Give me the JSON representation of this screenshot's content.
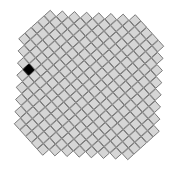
{
  "figure": {
    "title": "",
    "background_color": "#ffffff",
    "width": 179,
    "height": 170
  },
  "chart_data": {
    "type": "heatmap",
    "title": "",
    "subtitle": "",
    "xlabel": "",
    "ylabel": "",
    "grid": false,
    "legend": null,
    "geometry": {
      "cell_size_px": 8.6,
      "rotation_deg": -42,
      "origin_x_px": 89,
      "origin_y_px": 85,
      "cols": 19,
      "rows": 19
    },
    "colors": {
      "cell_fill": "#d6d6d6",
      "cell_stroke": "#777777",
      "selected_fill": "#000000",
      "background": "#ffffff"
    },
    "selected_cell": {
      "col": 5,
      "row": 3,
      "value": 1
    },
    "categories": [
      "col-0",
      "col-1",
      "col-2",
      "col-3",
      "col-4",
      "col-5",
      "col-6",
      "col-7",
      "col-8",
      "col-9",
      "col-10",
      "col-11",
      "col-12",
      "col-13",
      "col-14",
      "col-15",
      "col-16",
      "col-17",
      "col-18"
    ],
    "values": [
      [
        0,
        0,
        0,
        0,
        0,
        0,
        0,
        1,
        1,
        1,
        1,
        1,
        0,
        0,
        0,
        0,
        0,
        0,
        0
      ],
      [
        0,
        0,
        0,
        0,
        0,
        0,
        1,
        1,
        1,
        1,
        1,
        1,
        1,
        0,
        0,
        0,
        0,
        0,
        0
      ],
      [
        0,
        0,
        0,
        0,
        0,
        1,
        1,
        1,
        1,
        1,
        1,
        1,
        1,
        1,
        0,
        0,
        0,
        0,
        0
      ],
      [
        0,
        0,
        0,
        0,
        1,
        1,
        1,
        1,
        1,
        1,
        1,
        1,
        1,
        1,
        1,
        0,
        0,
        0,
        0
      ],
      [
        0,
        0,
        0,
        1,
        1,
        1,
        1,
        1,
        1,
        1,
        1,
        1,
        1,
        1,
        1,
        1,
        0,
        0,
        0
      ],
      [
        0,
        0,
        1,
        1,
        1,
        1,
        1,
        1,
        1,
        1,
        1,
        1,
        1,
        1,
        1,
        1,
        1,
        0,
        0
      ],
      [
        0,
        1,
        1,
        1,
        1,
        1,
        1,
        1,
        1,
        1,
        1,
        1,
        1,
        1,
        1,
        1,
        1,
        1,
        0
      ],
      [
        1,
        1,
        1,
        1,
        1,
        1,
        1,
        1,
        1,
        1,
        1,
        1,
        1,
        1,
        1,
        1,
        1,
        1,
        1
      ],
      [
        1,
        1,
        1,
        1,
        1,
        1,
        1,
        1,
        1,
        1,
        1,
        1,
        1,
        1,
        1,
        1,
        1,
        1,
        1
      ],
      [
        1,
        1,
        1,
        1,
        1,
        1,
        1,
        1,
        1,
        1,
        1,
        1,
        1,
        1,
        1,
        1,
        1,
        1,
        1
      ],
      [
        1,
        1,
        1,
        1,
        1,
        1,
        1,
        1,
        1,
        1,
        1,
        1,
        1,
        1,
        1,
        1,
        1,
        1,
        1
      ],
      [
        1,
        1,
        1,
        1,
        1,
        1,
        1,
        1,
        1,
        1,
        1,
        1,
        1,
        1,
        1,
        1,
        1,
        1,
        1
      ],
      [
        0,
        1,
        1,
        1,
        1,
        1,
        1,
        1,
        1,
        1,
        1,
        1,
        1,
        1,
        1,
        1,
        1,
        1,
        0
      ],
      [
        0,
        0,
        1,
        1,
        1,
        1,
        1,
        1,
        1,
        1,
        1,
        1,
        1,
        1,
        1,
        1,
        1,
        0,
        0
      ],
      [
        0,
        0,
        0,
        1,
        1,
        1,
        1,
        1,
        1,
        1,
        1,
        1,
        1,
        1,
        1,
        1,
        0,
        0,
        0
      ],
      [
        0,
        0,
        0,
        0,
        1,
        1,
        1,
        1,
        1,
        1,
        1,
        1,
        1,
        1,
        1,
        0,
        0,
        0,
        0
      ],
      [
        0,
        0,
        0,
        0,
        0,
        1,
        1,
        1,
        1,
        1,
        1,
        1,
        1,
        1,
        0,
        0,
        0,
        0,
        0
      ],
      [
        0,
        0,
        0,
        0,
        0,
        0,
        1,
        1,
        1,
        1,
        1,
        1,
        1,
        0,
        0,
        0,
        0,
        0,
        0
      ],
      [
        0,
        0,
        0,
        0,
        0,
        0,
        0,
        1,
        1,
        1,
        1,
        1,
        0,
        0,
        0,
        0,
        0,
        0,
        0
      ]
    ]
  }
}
